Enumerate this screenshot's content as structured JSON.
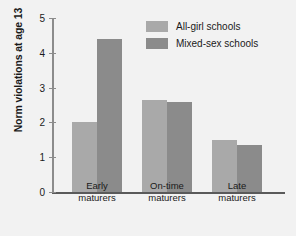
{
  "chart_data": {
    "type": "bar",
    "title": "",
    "xlabel": "",
    "ylabel": "Norm violations at age 13",
    "categories": [
      "Early maturers",
      "On-time maturers",
      "Late maturers"
    ],
    "category_lines": [
      [
        "Early",
        "maturers"
      ],
      [
        "On-time",
        "maturers"
      ],
      [
        "Late",
        "maturers"
      ]
    ],
    "series": [
      {
        "name": "All-girl schools",
        "values": [
          2.0,
          2.65,
          1.5
        ],
        "color": "#a9a9a9"
      },
      {
        "name": "Mixed-sex schools",
        "values": [
          4.4,
          2.6,
          1.35
        ],
        "color": "#8b8b8b"
      }
    ],
    "ylim": [
      0,
      5
    ],
    "yticks": [
      0,
      1,
      2,
      3,
      4,
      5
    ],
    "ytick_labels": [
      "0",
      "1",
      "2",
      "3",
      "4",
      "5"
    ],
    "grid": false,
    "legend_position": "top-right",
    "background_color": "#f2f2f2",
    "axis_color": "#5a5a5a"
  }
}
